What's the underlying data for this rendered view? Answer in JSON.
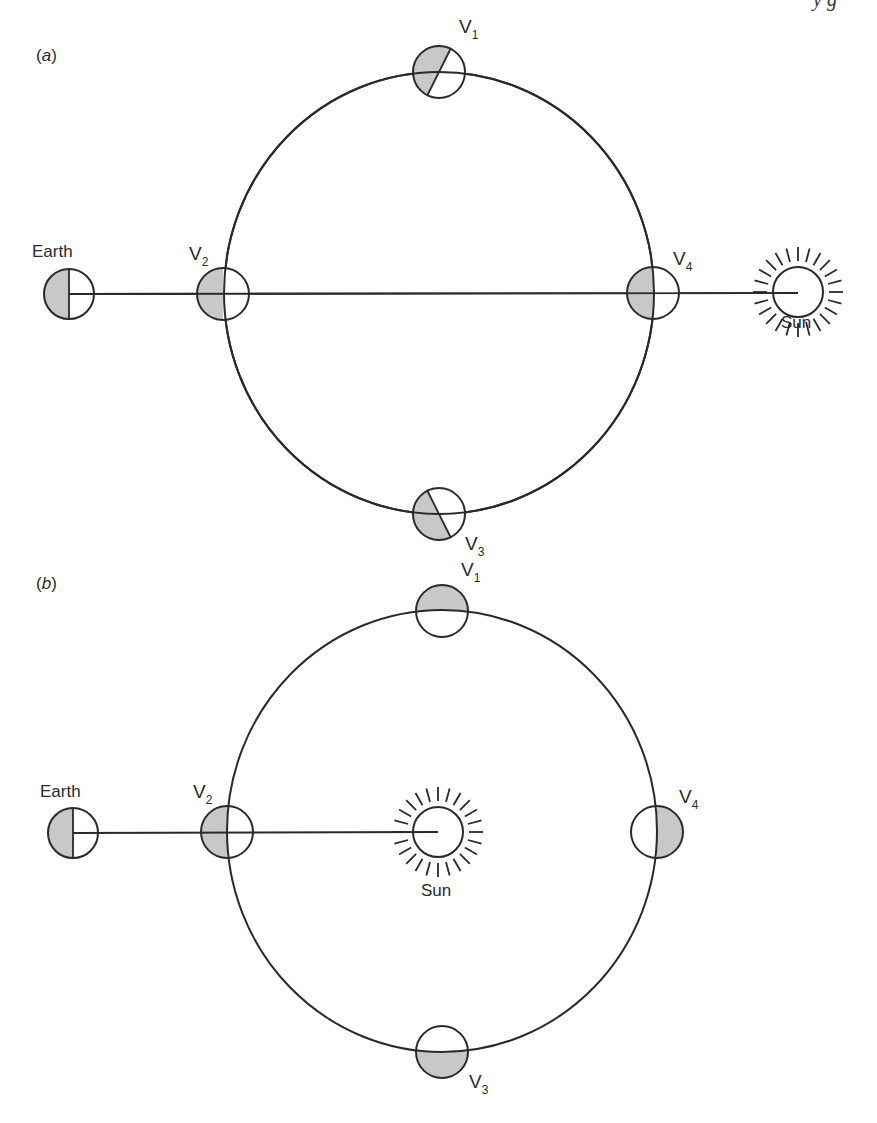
{
  "header_fragment": "y  g",
  "colors": {
    "line": "#2a2a2a",
    "shade": "#c8c8c8",
    "background": "#ffffff"
  },
  "panels": [
    {
      "id": "a",
      "label_open": "(",
      "label_letter": "a",
      "label_close": ")",
      "earth_label": "Earth",
      "sun_label": "Sun",
      "description": "Sun beyond orbit on Earth-Venus line; Venus always shown half-lit",
      "venus": [
        {
          "name": "V",
          "sub": "1",
          "position": "top",
          "shading": "lit-half-rotated"
        },
        {
          "name": "V",
          "sub": "2",
          "position": "left",
          "shading": "left-half-dark"
        },
        {
          "name": "V",
          "sub": "3",
          "position": "bottom",
          "shading": "lit-half-rotated"
        },
        {
          "name": "V",
          "sub": "4",
          "position": "right",
          "shading": "left-half-dark"
        }
      ]
    },
    {
      "id": "b",
      "label_open": "(",
      "label_letter": "b",
      "label_close": ")",
      "earth_label": "Earth",
      "sun_label": "Sun",
      "description": "Sun at center of Venus orbit",
      "venus": [
        {
          "name": "V",
          "sub": "1",
          "position": "top",
          "shading": "top-half-dark"
        },
        {
          "name": "V",
          "sub": "2",
          "position": "left",
          "shading": "left-half-dark"
        },
        {
          "name": "V",
          "sub": "3",
          "position": "bottom",
          "shading": "bottom-half-dark"
        },
        {
          "name": "V",
          "sub": "4",
          "position": "right",
          "shading": "right-half-dark"
        }
      ]
    }
  ]
}
